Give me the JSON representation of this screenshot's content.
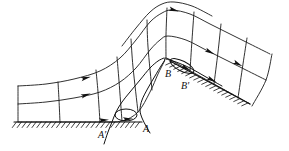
{
  "figure": {
    "name": "flow-separation-over-hill-diagram",
    "type": "line-diagram",
    "background_color": "#ffffff",
    "line_color": "#1a1a1a",
    "stroke_width": 0.9
  },
  "labels": [
    {
      "id": "A-prime",
      "text": "A'",
      "x": 98,
      "y": 138
    },
    {
      "id": "A",
      "text": "A",
      "x": 143,
      "y": 132
    },
    {
      "id": "B",
      "text": "B",
      "x": 165,
      "y": 77
    },
    {
      "id": "B-prime",
      "text": "B'",
      "x": 181,
      "y": 89
    }
  ],
  "chart_data": {
    "type": "line",
    "title": "",
    "xlabel": "",
    "ylabel": "",
    "grid": true,
    "legend": false,
    "ground_baseline_y": 122,
    "hill_crest": {
      "x": 166,
      "y": 58
    },
    "streamlines": [
      {
        "name": "wall-streamline",
        "points": [
          [
            18,
            122
          ],
          [
            60,
            122
          ],
          [
            100,
            122
          ],
          [
            122,
            121
          ],
          [
            138,
            112
          ],
          [
            150,
            92
          ],
          [
            158,
            74
          ],
          [
            164,
            62
          ],
          [
            166,
            58
          ],
          [
            178,
            64
          ],
          [
            196,
            74
          ],
          [
            214,
            84
          ],
          [
            232,
            94
          ],
          [
            250,
            104
          ]
        ]
      },
      {
        "name": "streamline-1",
        "points": [
          [
            18,
            104
          ],
          [
            46,
            102
          ],
          [
            74,
            98
          ],
          [
            100,
            92
          ],
          [
            120,
            82
          ],
          [
            136,
            68
          ],
          [
            150,
            50
          ],
          [
            160,
            40
          ],
          [
            168,
            36
          ],
          [
            186,
            40
          ],
          [
            206,
            50
          ],
          [
            226,
            60
          ],
          [
            246,
            70
          ],
          [
            266,
            80
          ]
        ]
      },
      {
        "name": "streamline-2",
        "points": [
          [
            18,
            86
          ],
          [
            46,
            84
          ],
          [
            74,
            79
          ],
          [
            100,
            71
          ],
          [
            120,
            58
          ],
          [
            136,
            40
          ],
          [
            150,
            22
          ],
          [
            162,
            13
          ],
          [
            172,
            10
          ],
          [
            190,
            14
          ],
          [
            210,
            24
          ],
          [
            230,
            34
          ],
          [
            250,
            44
          ],
          [
            270,
            54
          ]
        ]
      },
      {
        "name": "streamline-3-partial",
        "points": [
          [
            122,
            46
          ],
          [
            136,
            28
          ],
          [
            150,
            12
          ],
          [
            162,
            4
          ],
          [
            174,
            2
          ],
          [
            192,
            6
          ],
          [
            212,
            16
          ]
        ]
      }
    ],
    "cross_lines": [
      {
        "name": "cross-0",
        "points": [
          [
            18,
            122
          ],
          [
            18,
            104
          ],
          [
            18,
            86
          ]
        ]
      },
      {
        "name": "cross-1",
        "points": [
          [
            60,
            122
          ],
          [
            59,
            100
          ],
          [
            58,
            82
          ]
        ]
      },
      {
        "name": "cross-2",
        "points": [
          [
            100,
            122
          ],
          [
            98,
            92
          ],
          [
            96,
            70
          ]
        ]
      },
      {
        "name": "cross-3",
        "points": [
          [
            122,
            121
          ],
          [
            119,
            81
          ],
          [
            117,
            57
          ]
        ]
      },
      {
        "name": "cross-4",
        "points": [
          [
            138,
            112
          ],
          [
            133,
            67
          ],
          [
            131,
            39
          ]
        ]
      },
      {
        "name": "cross-5",
        "points": [
          [
            152,
            90
          ],
          [
            148,
            47
          ],
          [
            147,
            20
          ]
        ]
      },
      {
        "name": "cross-6",
        "points": [
          [
            166,
            58
          ],
          [
            166,
            35
          ],
          [
            167,
            8
          ]
        ]
      },
      {
        "name": "cross-7",
        "points": [
          [
            190,
            71
          ],
          [
            192,
            40
          ],
          [
            194,
            12
          ]
        ]
      },
      {
        "name": "cross-8",
        "points": [
          [
            214,
            84
          ],
          [
            218,
            52
          ],
          [
            221,
            24
          ]
        ]
      },
      {
        "name": "cross-9",
        "points": [
          [
            238,
            98
          ],
          [
            243,
            64
          ],
          [
            247,
            38
          ]
        ]
      },
      {
        "name": "cross-10",
        "points": [
          [
            252,
            106
          ],
          [
            266,
            80
          ],
          [
            272,
            54
          ]
        ]
      }
    ],
    "arrow_markers": [
      {
        "name": "arrow-upstream-low",
        "x": 86,
        "y": 95,
        "angle": -18
      },
      {
        "name": "arrow-upstream-mid",
        "x": 86,
        "y": 78,
        "angle": -14
      },
      {
        "name": "arrow-crest-upper",
        "x": 174,
        "y": 10,
        "angle": 16
      },
      {
        "name": "arrow-down-1",
        "x": 210,
        "y": 52,
        "angle": 27
      },
      {
        "name": "arrow-down-2",
        "x": 212,
        "y": 80,
        "angle": 28
      },
      {
        "name": "arrow-down-3",
        "x": 238,
        "y": 64,
        "angle": 27
      },
      {
        "name": "arrow-wall-a",
        "x": 104,
        "y": 120,
        "angle": -4
      },
      {
        "name": "arrow-wall-b",
        "x": 128,
        "y": 119,
        "angle": -4
      },
      {
        "name": "arrow-sep-b",
        "x": 186,
        "y": 68,
        "angle": 26
      }
    ],
    "separation_bubbles": [
      {
        "name": "bubble-A",
        "cx": 126,
        "cy": 115,
        "rx": 11,
        "ry": 6
      },
      {
        "name": "bubble-B",
        "cx": 182,
        "cy": 66,
        "rx": 13,
        "ry": 5,
        "rot": 27
      }
    ],
    "hatched_surfaces": [
      {
        "name": "ground-left",
        "x1": 14,
        "y1": 122,
        "x2": 142,
        "y2": 122,
        "ticks": 26,
        "side": "below"
      },
      {
        "name": "slope-right",
        "x1": 170,
        "y1": 61,
        "x2": 250,
        "y2": 104,
        "ticks": 20,
        "side": "below"
      }
    ],
    "dividing_streamlines": [
      {
        "name": "A-prime-dividing",
        "points": [
          [
            104,
            144
          ],
          [
            108,
            132
          ],
          [
            112,
            122
          ],
          [
            116,
            112
          ],
          [
            122,
            102
          ],
          [
            130,
            92
          ],
          [
            140,
            80
          ],
          [
            150,
            68
          ],
          [
            158,
            61
          ],
          [
            164,
            58
          ]
        ]
      },
      {
        "name": "A-dividing",
        "points": [
          [
            150,
            133
          ],
          [
            146,
            126
          ],
          [
            142,
            118
          ],
          [
            140,
            110
          ],
          [
            142,
            100
          ],
          [
            148,
            88
          ],
          [
            155,
            76
          ],
          [
            161,
            66
          ],
          [
            165,
            60
          ]
        ]
      },
      {
        "name": "B-dividing",
        "points": [
          [
            166,
            59
          ],
          [
            176,
            62
          ],
          [
            190,
            68
          ],
          [
            206,
            77
          ],
          [
            222,
            86
          ]
        ]
      }
    ]
  }
}
